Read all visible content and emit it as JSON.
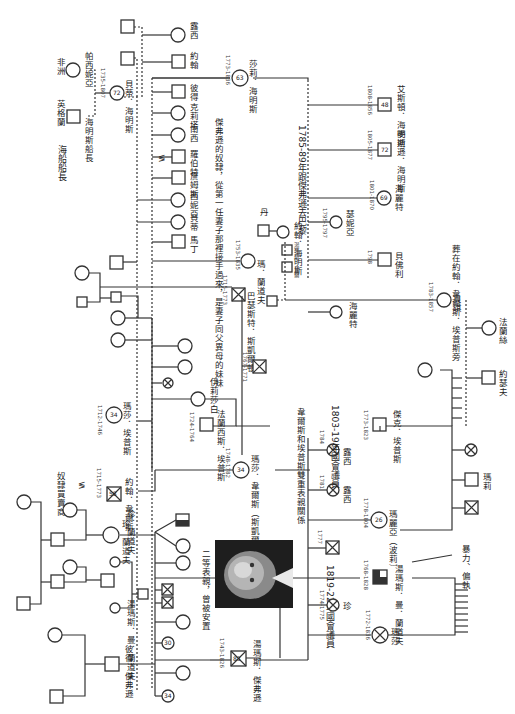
{
  "colors": {
    "line": "#333333",
    "background": "#ffffff",
    "affected_fill": "#333333"
  },
  "places": {
    "england": "英格蘭",
    "africa": "非洲"
  },
  "people": [
    {
      "id": "captain_hemings",
      "label": "海明斯船長",
      "sex": "male",
      "place": "英格蘭"
    },
    {
      "id": "parthenia",
      "label": "帕西妮亞",
      "sex": "female",
      "place": "非洲"
    },
    {
      "id": "betty_hemings",
      "label": "貝蒂．海明斯",
      "sex": "female",
      "years": "1735-1807",
      "age": "72"
    },
    {
      "id": "sally_hemings",
      "label": "莎莉．海明斯",
      "sex": "female",
      "years": "1773-1836",
      "age": "63"
    },
    {
      "id": "peter",
      "label": "彼得",
      "sex": "male"
    },
    {
      "id": "critta",
      "label": "克莉塔",
      "sex": "female"
    },
    {
      "id": "nance",
      "label": "南西",
      "sex": "female"
    },
    {
      "id": "robert",
      "label": "羅伯特",
      "sex": "male"
    },
    {
      "id": "james",
      "label": "詹姆斯",
      "sex": "male"
    },
    {
      "id": "thenia",
      "label": "西妮亞",
      "sex": "female"
    },
    {
      "id": "bett",
      "label": "貝蒂",
      "sex": "female"
    },
    {
      "id": "martin",
      "label": "馬丁",
      "sex": "male"
    },
    {
      "id": "john",
      "label": "約翰",
      "sex": "male"
    },
    {
      "id": "lucy",
      "label": "露西",
      "sex": "female"
    },
    {
      "id": "eston",
      "label": "艾斯頓．海明斯",
      "sex": "male",
      "years": "1808-1856",
      "age": "48"
    },
    {
      "id": "madison",
      "label": "麥迪遜．海明斯",
      "sex": "male",
      "years": "1805-1877",
      "age": "72"
    },
    {
      "id": "harriet2",
      "label": "海麗特",
      "sex": "female",
      "years": "1801-1870",
      "age": "69"
    },
    {
      "id": "harriet1",
      "label": "海麗特",
      "sex": "female",
      "years": "1795-1797"
    },
    {
      "id": "beverly",
      "label": "貝佛利",
      "sex": "male",
      "years": "1798"
    },
    {
      "id": "unnamed_daughter",
      "label": "瑟妮亞",
      "sex": "female",
      "years": "1799-1801"
    },
    {
      "id": "thomas_mann_randolph",
      "label": "湯瑪斯．曼．蘭道夫",
      "sex": "male",
      "years": "1768-1828"
    },
    {
      "id": "martha_jefferson",
      "label": "瑪莎",
      "sex": "female",
      "years": "1772-1836",
      "age": "64"
    },
    {
      "id": "jane",
      "label": "珍",
      "sex": "female",
      "years": "1774-1775"
    },
    {
      "id": "son1777",
      "label": "",
      "sex": "male",
      "years": "1777",
      "deceased": true
    },
    {
      "id": "mary",
      "label": "瑪麗亞（波莉）",
      "sex": "female",
      "years": "1778-1804",
      "age": "26"
    },
    {
      "id": "lucy1781",
      "label": "露西",
      "sex": "female",
      "years": "1781"
    },
    {
      "id": "lucy1784",
      "label": "露西",
      "sex": "female",
      "years": "1784"
    },
    {
      "id": "martha_wayles",
      "label": "瑪莎．韋爾斯（斯凱爾頓）",
      "sex": "female",
      "years": "1748-1782",
      "age": "34"
    },
    {
      "id": "bathurst_skelton",
      "label": "巴瑟斯特．斯凱爾頓",
      "sex": "male",
      "years": "1768"
    },
    {
      "id": "john_wayles",
      "label": "約翰．韋爾斯",
      "sex": "male",
      "years": "1715-1773",
      "age": "58"
    },
    {
      "id": "martha_epps",
      "label": "瑪莎．埃普斯",
      "sex": "female",
      "years": "1712-1746",
      "age": "34"
    },
    {
      "id": "francis_epps",
      "label": "法蘭西斯．埃普斯",
      "sex": "male",
      "years": "1724-1764"
    },
    {
      "id": "elizabeth",
      "label": "伊莉莎白",
      "sex": "female"
    },
    {
      "id": "son1767",
      "label": "",
      "sex": "male",
      "years": "1767-1771",
      "deceased": true
    },
    {
      "id": "peter_jefferson",
      "label": "彼得．傑弗遜",
      "sex": "male"
    },
    {
      "id": "jane_randolph",
      "label": "珍．蘭道夫",
      "sex": "female"
    },
    {
      "id": "thomas_jefferson",
      "label": "湯瑪斯．傑弗遜",
      "sex": "male",
      "years": "1743-1826",
      "age": "83"
    },
    {
      "id": "randolph_jefferson",
      "label": "湯瑪斯．曼．蘭道夫",
      "sex": "male"
    },
    {
      "id": "jack_eppes",
      "label": "傑克．埃普斯",
      "sex": "male",
      "years": "1773-1823"
    },
    {
      "id": "betsy",
      "label": "貝琪",
      "sex": "female",
      "years": "1783-1857"
    },
    {
      "id": "frances",
      "label": "法蘭絲",
      "sex": "female"
    },
    {
      "id": "joseph",
      "label": "約瑟夫",
      "sex": "male"
    },
    {
      "id": "francis",
      "label": "法蘭斯",
      "sex": "male"
    },
    {
      "id": "mary_bell",
      "label": "瑪莉",
      "sex": "female"
    },
    {
      "id": "john_hemings",
      "label": "約翰．海明斯",
      "sex": "male"
    },
    {
      "id": "tenia_randolph",
      "label": "湯瑪斯．貝爾",
      "sex": "male"
    },
    {
      "id": "dan",
      "label": "丹",
      "sex": "male"
    }
  ],
  "annotations": {
    "sea_captain": "海船船長",
    "slave_trader": "奴隸買賣商",
    "jefferson_slave_note": "傑弗遜的奴隸，從第一任妻子那裡接手過來，是妻子同父異母的妹妹",
    "paris_note": "1785-89年跟傑弗遜去巴黎",
    "buried_note": "葬在約翰．韋爾斯．埃普斯旁",
    "double_cousin_note": "韋爾斯和埃普斯雙重表親關係",
    "congress_note_1": "1803-19年國會議員",
    "congress_note_2": "1819-22年國會議員",
    "photo_caption": "二等表親，曾被安置",
    "violence_note": "暴力、偏執",
    "randolph_label": "湯瑪斯．曼．蘭道夫",
    "mary_randolph": "瑪．蘭道夫"
  },
  "photo": {
    "subject": "portrait-photo"
  }
}
